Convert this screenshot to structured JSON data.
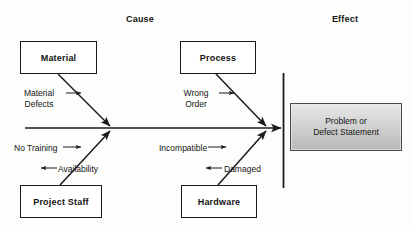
{
  "diagram": {
    "type": "fishbone-ishikawa",
    "headers": {
      "cause": "Cause",
      "effect": "Effect"
    },
    "effect_box": {
      "label": "Problem or\nDefect Statement",
      "fill_top": "#e8e8e8",
      "fill_bottom": "#b9b9b9",
      "border": "#4a4a4a"
    },
    "categories": [
      {
        "id": "material",
        "label": "Material",
        "position": "top-left"
      },
      {
        "id": "process",
        "label": "Process",
        "position": "top-right"
      },
      {
        "id": "project-staff",
        "label": "Project Staff",
        "position": "bottom-left"
      },
      {
        "id": "hardware",
        "label": "Hardware",
        "position": "bottom-right"
      }
    ],
    "causes": [
      {
        "id": "material-defects",
        "label": "Material\nDefects",
        "parent": "material",
        "arrow": "right"
      },
      {
        "id": "wrong-order",
        "label": "Wrong\nOrder",
        "parent": "process",
        "arrow": "right"
      },
      {
        "id": "no-training",
        "label": "No Training",
        "parent": "project-staff",
        "arrow": "right"
      },
      {
        "id": "availability",
        "label": "Availability",
        "parent": "project-staff",
        "arrow": "left"
      },
      {
        "id": "incompatible",
        "label": "Incompatible",
        "parent": "hardware",
        "arrow": "right"
      },
      {
        "id": "damaged",
        "label": "Damaged",
        "parent": "hardware",
        "arrow": "left"
      }
    ],
    "colors": {
      "line": "#1b1b1b",
      "box_border": "#1b1b1b",
      "background": "#fdfdfc",
      "text": "#141414"
    }
  }
}
